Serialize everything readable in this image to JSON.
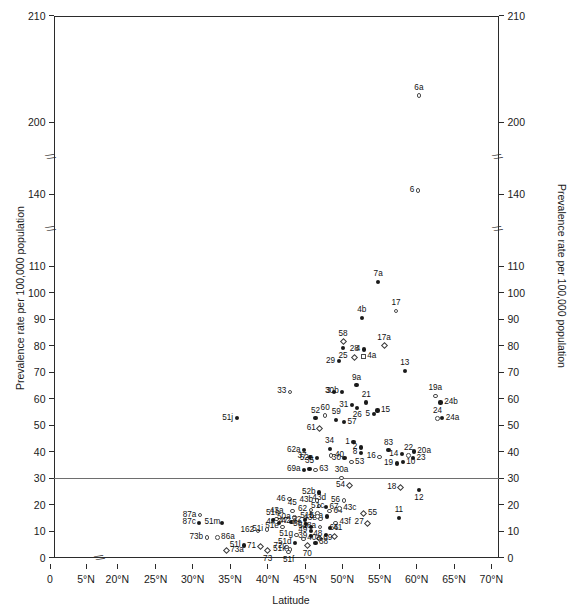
{
  "chart_data": {
    "type": "scatter",
    "title": "",
    "xlabel": "Latitude",
    "ylabel": "Prevalence rate per 100,000 population",
    "xlim": [
      0,
      72.5
    ],
    "ylim": [
      0,
      210
    ],
    "grid": false,
    "legend": null,
    "axis_breaks": {
      "x": [
        "between 5°N and 20°N"
      ],
      "y": [
        "between 200 and 140",
        "between 140 and 110"
      ]
    },
    "reference_lines": [
      {
        "axis": "y",
        "value": 30,
        "color": "#6e6e6e"
      }
    ],
    "x_ticks": [
      "0",
      "5°N",
      "20°N",
      "25°N",
      "30°N",
      "35°N",
      "40°N",
      "45°N",
      "50°N",
      "55°N",
      "60°N",
      "65°N",
      "70°N"
    ],
    "x_tick_values": [
      0,
      5,
      20,
      25,
      30,
      35,
      40,
      45,
      50,
      55,
      60,
      65,
      70
    ],
    "y_ticks": [
      "0",
      "10",
      "20",
      "30",
      "40",
      "50",
      "60",
      "70",
      "80",
      "90",
      "100",
      "110",
      "140",
      "200",
      "210"
    ],
    "y_tick_values": [
      0,
      10,
      20,
      30,
      40,
      50,
      60,
      70,
      80,
      90,
      100,
      110,
      140,
      200,
      210
    ],
    "marker_styles": [
      "filled-circle",
      "open-circle",
      "open-diamond",
      "open-square"
    ],
    "points": [
      {
        "label": "6a",
        "x": 60.3,
        "y": 202.5,
        "marker": "open-circle",
        "lpos": "above"
      },
      {
        "label": "6",
        "x": 60.2,
        "y": 143.0,
        "marker": "open-circle",
        "lpos": "left"
      },
      {
        "label": "7a",
        "x": 54.8,
        "y": 104.0,
        "marker": "filled-circle",
        "lpos": "above"
      },
      {
        "label": "17",
        "x": 57.2,
        "y": 93.0,
        "marker": "open-circle",
        "lpos": "above"
      },
      {
        "label": "4b",
        "x": 52.6,
        "y": 90.5,
        "marker": "filled-circle",
        "lpos": "above"
      },
      {
        "label": "58",
        "x": 50.1,
        "y": 81.5,
        "marker": "open-diamond",
        "lpos": "above"
      },
      {
        "label": "25",
        "x": 50.1,
        "y": 79.0,
        "marker": "filled-circle",
        "lpos": "below"
      },
      {
        "label": "4",
        "x": 52.9,
        "y": 78.5,
        "marker": "filled-circle",
        "lpos": "left"
      },
      {
        "label": "17a",
        "x": 55.6,
        "y": 80.0,
        "marker": "open-diamond",
        "lpos": "above"
      },
      {
        "label": "28",
        "x": 51.6,
        "y": 75.5,
        "marker": "open-diamond",
        "lpos": "above"
      },
      {
        "label": "4a",
        "x": 52.8,
        "y": 76.0,
        "marker": "open-square",
        "lpos": "right"
      },
      {
        "label": "29",
        "x": 49.5,
        "y": 74.0,
        "marker": "filled-circle",
        "lpos": "left"
      },
      {
        "label": "13",
        "x": 58.4,
        "y": 70.5,
        "marker": "filled-circle",
        "lpos": "above"
      },
      {
        "label": "9a",
        "x": 51.9,
        "y": 65.0,
        "marker": "filled-circle",
        "lpos": "above"
      },
      {
        "label": "33",
        "x": 43.0,
        "y": 62.5,
        "marker": "open-circle",
        "lpos": "left"
      },
      {
        "label": "3",
        "x": 48.9,
        "y": 62.5,
        "marker": "filled-circle",
        "lpos": "left"
      },
      {
        "label": "30b",
        "x": 50.0,
        "y": 62.5,
        "marker": "filled-circle",
        "lpos": "left"
      },
      {
        "label": "19a",
        "x": 62.5,
        "y": 61.0,
        "marker": "open-circle",
        "lpos": "above"
      },
      {
        "label": "24b",
        "x": 63.2,
        "y": 58.5,
        "marker": "filled-circle",
        "lpos": "right"
      },
      {
        "label": "21",
        "x": 53.2,
        "y": 58.5,
        "marker": "filled-circle",
        "lpos": "above"
      },
      {
        "label": "31",
        "x": 51.3,
        "y": 57.5,
        "marker": "filled-circle",
        "lpos": "left"
      },
      {
        "label": "26",
        "x": 52.0,
        "y": 56.5,
        "marker": "filled-circle",
        "lpos": "below"
      },
      {
        "label": "15",
        "x": 54.7,
        "y": 55.5,
        "marker": "filled-circle",
        "lpos": "right"
      },
      {
        "label": "5",
        "x": 54.2,
        "y": 54.0,
        "marker": "filled-circle",
        "lpos": "left"
      },
      {
        "label": "24",
        "x": 62.8,
        "y": 52.5,
        "marker": "open-circle",
        "lpos": "above"
      },
      {
        "label": "24a",
        "x": 63.4,
        "y": 52.5,
        "marker": "filled-circle",
        "lpos": "right"
      },
      {
        "label": "51j",
        "x": 35.9,
        "y": 52.5,
        "marker": "filled-circle",
        "lpos": "left"
      },
      {
        "label": "52",
        "x": 46.4,
        "y": 52.5,
        "marker": "filled-circle",
        "lpos": "above"
      },
      {
        "label": "60",
        "x": 47.7,
        "y": 53.5,
        "marker": "open-circle",
        "lpos": "above"
      },
      {
        "label": "59",
        "x": 49.2,
        "y": 52.0,
        "marker": "filled-circle",
        "lpos": "above"
      },
      {
        "label": "57",
        "x": 50.2,
        "y": 51.0,
        "marker": "filled-circle",
        "lpos": "right"
      },
      {
        "label": "61",
        "x": 47.0,
        "y": 48.5,
        "marker": "open-diamond",
        "lpos": "left"
      },
      {
        "label": "1",
        "x": 51.5,
        "y": 43.5,
        "marker": "filled-circle",
        "lpos": "left"
      },
      {
        "label": "2",
        "x": 52.5,
        "y": 41.5,
        "marker": "filled-circle",
        "lpos": "left"
      },
      {
        "label": "34",
        "x": 48.3,
        "y": 41.0,
        "marker": "filled-circle",
        "lpos": "above"
      },
      {
        "label": "62a",
        "x": 44.9,
        "y": 40.5,
        "marker": "filled-circle",
        "lpos": "left"
      },
      {
        "label": "83",
        "x": 56.2,
        "y": 40.5,
        "marker": "filled-circle",
        "lpos": "above"
      },
      {
        "label": "8",
        "x": 52.5,
        "y": 39.5,
        "marker": "filled-circle",
        "lpos": "left"
      },
      {
        "label": "20a",
        "x": 59.6,
        "y": 40.0,
        "marker": "filled-circle",
        "lpos": "right"
      },
      {
        "label": "14",
        "x": 58.0,
        "y": 39.0,
        "marker": "filled-circle",
        "lpos": "left"
      },
      {
        "label": "22",
        "x": 58.9,
        "y": 38.5,
        "marker": "open-circle",
        "lpos": "above"
      },
      {
        "label": "40",
        "x": 48.5,
        "y": 38.5,
        "marker": "open-circle",
        "lpos": "right"
      },
      {
        "label": "37",
        "x": 45.7,
        "y": 38.0,
        "marker": "filled-circle",
        "lpos": "left"
      },
      {
        "label": "52a",
        "x": 46.6,
        "y": 37.5,
        "marker": "filled-circle",
        "lpos": "left"
      },
      {
        "label": "16",
        "x": 55.0,
        "y": 38.0,
        "marker": "open-circle",
        "lpos": "left"
      },
      {
        "label": "23",
        "x": 59.5,
        "y": 37.5,
        "marker": "filled-circle",
        "lpos": "right"
      },
      {
        "label": "30",
        "x": 50.3,
        "y": 37.5,
        "marker": "filled-circle",
        "lpos": "left"
      },
      {
        "label": "53",
        "x": 51.2,
        "y": 36.0,
        "marker": "open-circle",
        "lpos": "right"
      },
      {
        "label": "10",
        "x": 58.1,
        "y": 36.0,
        "marker": "filled-circle",
        "lpos": "right"
      },
      {
        "label": "19",
        "x": 57.3,
        "y": 35.5,
        "marker": "filled-circle",
        "lpos": "left"
      },
      {
        "label": "35",
        "x": 45.6,
        "y": 33.5,
        "marker": "filled-circle",
        "lpos": "above"
      },
      {
        "label": "63",
        "x": 46.4,
        "y": 33.0,
        "marker": "open-circle",
        "lpos": "right"
      },
      {
        "label": "69a",
        "x": 44.9,
        "y": 33.0,
        "marker": "filled-circle",
        "lpos": "left"
      },
      {
        "label": "30a",
        "x": 49.9,
        "y": 30.0,
        "marker": "open-circle",
        "lpos": "above"
      },
      {
        "label": "54",
        "x": 50.9,
        "y": 27.0,
        "marker": "open-diamond",
        "lpos": "left"
      },
      {
        "label": "18",
        "x": 57.8,
        "y": 26.5,
        "marker": "open-diamond",
        "lpos": "left"
      },
      {
        "label": "12",
        "x": 60.3,
        "y": 25.5,
        "marker": "filled-circle",
        "lpos": "below"
      },
      {
        "label": "52b",
        "x": 46.9,
        "y": 24.5,
        "marker": "filled-circle",
        "lpos": "left"
      },
      {
        "label": "46",
        "x": 42.9,
        "y": 22.0,
        "marker": "open-circle",
        "lpos": "left"
      },
      {
        "label": "43b",
        "x": 46.6,
        "y": 21.5,
        "marker": "open-circle",
        "lpos": "left"
      },
      {
        "label": "56",
        "x": 50.2,
        "y": 21.5,
        "marker": "open-circle",
        "lpos": "left"
      },
      {
        "label": "67",
        "x": 47.8,
        "y": 19.0,
        "marker": "filled-circle",
        "lpos": "right"
      },
      {
        "label": "43d",
        "x": 46.9,
        "y": 19.5,
        "marker": "open-circle",
        "lpos": "above"
      },
      {
        "label": "45",
        "x": 43.3,
        "y": 17.5,
        "marker": "open-circle",
        "lpos": "above"
      },
      {
        "label": "62",
        "x": 45.8,
        "y": 18.0,
        "marker": "open-circle",
        "lpos": "left"
      },
      {
        "label": "64",
        "x": 48.3,
        "y": 17.5,
        "marker": "open-circle",
        "lpos": "right"
      },
      {
        "label": "43c",
        "x": 49.6,
        "y": 18.5,
        "marker": "open-circle",
        "lpos": "right"
      },
      {
        "label": "55",
        "x": 52.9,
        "y": 16.5,
        "marker": "open-diamond",
        "lpos": "right"
      },
      {
        "label": "11",
        "x": 57.6,
        "y": 15.0,
        "marker": "filled-circle",
        "lpos": "above"
      },
      {
        "label": "43a",
        "x": 41.2,
        "y": 14.5,
        "marker": "open-circle",
        "lpos": "above"
      },
      {
        "label": "50a",
        "x": 43.6,
        "y": 15.0,
        "marker": "open-circle",
        "lpos": "left"
      },
      {
        "label": "51a",
        "x": 47.9,
        "y": 15.5,
        "marker": "filled-circle",
        "lpos": "left"
      },
      {
        "label": "47",
        "x": 43.2,
        "y": 13.5,
        "marker": "filled-circle",
        "lpos": "left"
      },
      {
        "label": "87a",
        "x": 31.0,
        "y": 16.0,
        "marker": "open-circle",
        "lpos": "left"
      },
      {
        "label": "87c",
        "x": 30.9,
        "y": 13.0,
        "marker": "filled-circle",
        "lpos": "left"
      },
      {
        "label": "51m",
        "x": 33.9,
        "y": 13.0,
        "marker": "filled-circle",
        "lpos": "left"
      },
      {
        "label": "51h",
        "x": 40.7,
        "y": 14.0,
        "marker": "filled-circle",
        "lpos": "above"
      },
      {
        "label": "44",
        "x": 41.5,
        "y": 13.0,
        "marker": "filled-circle",
        "lpos": "left"
      },
      {
        "label": "42",
        "x": 43.6,
        "y": 13.5,
        "marker": "open-circle",
        "lpos": "left"
      },
      {
        "label": "32",
        "x": 45.0,
        "y": 14.0,
        "marker": "filled-circle",
        "lpos": "left"
      },
      {
        "label": "50",
        "x": 45.1,
        "y": 12.5,
        "marker": "filled-circle",
        "lpos": "left"
      },
      {
        "label": "43e",
        "x": 47.1,
        "y": 14.5,
        "marker": "open-circle",
        "lpos": "left"
      },
      {
        "label": "43f",
        "x": 49.1,
        "y": 13.0,
        "marker": "open-circle",
        "lpos": "right"
      },
      {
        "label": "51c",
        "x": 46.7,
        "y": 16.5,
        "marker": "open-circle",
        "lpos": "above"
      },
      {
        "label": "51b",
        "x": 46.7,
        "y": 15.5,
        "marker": "open-circle",
        "lpos": "left"
      },
      {
        "label": "51e",
        "x": 42.0,
        "y": 11.5,
        "marker": "open-circle",
        "lpos": "left"
      },
      {
        "label": "51",
        "x": 45.8,
        "y": 11.5,
        "marker": "filled-circle",
        "lpos": "left"
      },
      {
        "label": "48a",
        "x": 47.0,
        "y": 11.5,
        "marker": "open-circle",
        "lpos": "left"
      },
      {
        "label": "41",
        "x": 48.3,
        "y": 11.0,
        "marker": "filled-circle",
        "lpos": "right"
      },
      {
        "label": "49",
        "x": 45.8,
        "y": 10.0,
        "marker": "filled-circle",
        "lpos": "left"
      },
      {
        "label": "162",
        "x": 38.7,
        "y": 10.0,
        "marker": "open-circle",
        "lpos": "left"
      },
      {
        "label": "51i",
        "x": 39.9,
        "y": 10.5,
        "marker": "open-circle",
        "lpos": "left"
      },
      {
        "label": "27",
        "x": 53.4,
        "y": 13.0,
        "marker": "open-diamond",
        "lpos": "left"
      },
      {
        "label": "51g",
        "x": 43.9,
        "y": 8.5,
        "marker": "open-circle",
        "lpos": "left"
      },
      {
        "label": "39",
        "x": 45.8,
        "y": 8.0,
        "marker": "filled-circle",
        "lpos": "left"
      },
      {
        "label": "48",
        "x": 47.8,
        "y": 8.5,
        "marker": "filled-circle",
        "lpos": "left"
      },
      {
        "label": "66",
        "x": 48.9,
        "y": 8.0,
        "marker": "open-diamond",
        "lpos": "above"
      },
      {
        "label": "69",
        "x": 46.9,
        "y": 7.0,
        "marker": "open-diamond",
        "lpos": "right"
      },
      {
        "label": "40a",
        "x": 44.8,
        "y": 7.0,
        "marker": "open-circle",
        "lpos": "right"
      },
      {
        "label": "73b",
        "x": 31.9,
        "y": 7.5,
        "marker": "open-circle",
        "lpos": "left"
      },
      {
        "label": "86a",
        "x": 33.3,
        "y": 7.5,
        "marker": "open-circle",
        "lpos": "right"
      },
      {
        "label": "51d",
        "x": 43.7,
        "y": 5.5,
        "marker": "filled-circle",
        "lpos": "left"
      },
      {
        "label": "38",
        "x": 46.4,
        "y": 5.5,
        "marker": "filled-circle",
        "lpos": "right"
      },
      {
        "label": "70",
        "x": 45.3,
        "y": 4.5,
        "marker": "open-diamond",
        "lpos": "below"
      },
      {
        "label": "51l",
        "x": 36.9,
        "y": 4.5,
        "marker": "filled-circle",
        "lpos": "left"
      },
      {
        "label": "71",
        "x": 39.0,
        "y": 4.0,
        "marker": "open-diamond",
        "lpos": "left"
      },
      {
        "label": "72",
        "x": 42.5,
        "y": 4.0,
        "marker": "open-circle",
        "lpos": "left"
      },
      {
        "label": "51k",
        "x": 43.0,
        "y": 3.0,
        "marker": "open-circle",
        "lpos": "left"
      },
      {
        "label": "73",
        "x": 40.0,
        "y": 2.5,
        "marker": "open-diamond",
        "lpos": "below"
      },
      {
        "label": "51f",
        "x": 42.8,
        "y": 2.0,
        "marker": "open-circle",
        "lpos": "below"
      },
      {
        "label": "73a",
        "x": 34.5,
        "y": 2.5,
        "marker": "open-diamond",
        "lpos": "right"
      }
    ]
  }
}
